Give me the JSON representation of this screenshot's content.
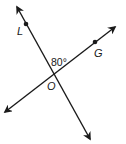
{
  "diagram": {
    "type": "intersecting-lines",
    "points": {
      "L": {
        "label": "L",
        "x": 26,
        "y": 25
      },
      "G": {
        "label": "G",
        "x": 95,
        "y": 42
      },
      "O": {
        "label": "O",
        "x": 53,
        "y": 73
      }
    },
    "angle": {
      "label": "80°",
      "between": [
        "L",
        "O",
        "G"
      ],
      "degrees": 80
    },
    "lines": [
      {
        "name": "line-LO",
        "from": [
          17,
          7
        ],
        "to": [
          90,
          139
        ],
        "arrows": "both"
      },
      {
        "name": "line-GO",
        "from": [
          5,
          112
        ],
        "to": [
          115,
          27
        ],
        "arrows": "both"
      }
    ],
    "colors": {
      "stroke": "#1a1a1a",
      "background": "#ffffff"
    }
  }
}
